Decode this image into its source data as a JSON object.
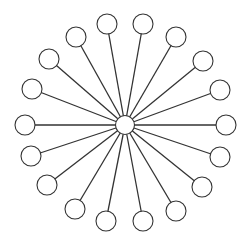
{
  "diagram": {
    "type": "star-graph",
    "background": "#ffffff",
    "stroke": "#333333",
    "node_fill": "#ffffff",
    "node_radius": 10,
    "center": {
      "id": "hub",
      "x": 125,
      "y": 125,
      "r": 9.5
    },
    "leaves": [
      {
        "id": "n1",
        "x": 107,
        "y": 24
      },
      {
        "id": "n2",
        "x": 143,
        "y": 24
      },
      {
        "id": "n3",
        "x": 176,
        "y": 37
      },
      {
        "id": "n4",
        "x": 203,
        "y": 61
      },
      {
        "id": "n5",
        "x": 220,
        "y": 90
      },
      {
        "id": "n6",
        "x": 226,
        "y": 125
      },
      {
        "id": "n7",
        "x": 220,
        "y": 157
      },
      {
        "id": "n8",
        "x": 202,
        "y": 187
      },
      {
        "id": "n9",
        "x": 176,
        "y": 211
      },
      {
        "id": "n10",
        "x": 143,
        "y": 221
      },
      {
        "id": "n11",
        "x": 106,
        "y": 221
      },
      {
        "id": "n12",
        "x": 75,
        "y": 209
      },
      {
        "id": "n13",
        "x": 47,
        "y": 185
      },
      {
        "id": "n14",
        "x": 31,
        "y": 156
      },
      {
        "id": "n15",
        "x": 25,
        "y": 125
      },
      {
        "id": "n16",
        "x": 32,
        "y": 89
      },
      {
        "id": "n17",
        "x": 49,
        "y": 59
      },
      {
        "id": "n18",
        "x": 76,
        "y": 37
      }
    ]
  }
}
